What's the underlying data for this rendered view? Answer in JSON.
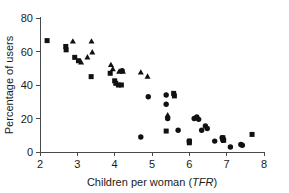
{
  "chart_data": {
    "type": "scatter",
    "title": "",
    "xlabel": "Children per woman (TFR)",
    "xlabel_plain": "Children per woman (",
    "xlabel_italic": "TFR",
    "xlabel_tail": ")",
    "ylabel": "Percentage of users",
    "xlim": [
      2,
      8
    ],
    "ylim": [
      0,
      80
    ],
    "xticks": [
      2,
      3,
      4,
      5,
      6,
      7,
      8
    ],
    "xticklabels": [
      "2",
      "3",
      "4",
      "5",
      "6",
      "7",
      "8"
    ],
    "yticks": [
      0,
      20,
      40,
      60,
      80
    ],
    "yticklabels": [
      "0",
      "20",
      "40",
      "60",
      "80"
    ],
    "grid": false,
    "legend": false,
    "marker_color": "#111111",
    "series": [
      {
        "name": "square",
        "marker": "square",
        "points": [
          [
            2.19,
            66.5
          ],
          [
            2.69,
            63.0
          ],
          [
            2.7,
            61.0
          ],
          [
            2.93,
            56.5
          ],
          [
            3.03,
            54.5
          ],
          [
            3.37,
            45.0
          ],
          [
            3.88,
            47.0
          ],
          [
            4.0,
            42.5
          ],
          [
            4.03,
            41.0
          ],
          [
            4.1,
            40.0
          ],
          [
            4.18,
            40.0
          ],
          [
            5.38,
            12.5
          ],
          [
            5.58,
            35.0
          ],
          [
            5.6,
            33.5
          ],
          [
            6.0,
            6.5
          ],
          [
            6.0,
            5.5
          ],
          [
            6.9,
            8.5
          ],
          [
            6.92,
            7.0
          ],
          [
            7.68,
            10.5
          ]
        ]
      },
      {
        "name": "triangle",
        "marker": "triangle",
        "points": [
          [
            2.88,
            66.0
          ],
          [
            3.38,
            66.0
          ],
          [
            3.1,
            53.5
          ],
          [
            3.27,
            56.5
          ],
          [
            3.4,
            59.5
          ],
          [
            3.9,
            52.0
          ],
          [
            3.95,
            49.5
          ],
          [
            4.22,
            48.0
          ],
          [
            4.7,
            47.5
          ],
          [
            4.88,
            45.0
          ],
          [
            5.42,
            22.0
          ],
          [
            4.12,
            48.0
          ]
        ]
      },
      {
        "name": "circle",
        "marker": "circle",
        "points": [
          [
            4.2,
            48.5
          ],
          [
            4.7,
            9.0
          ],
          [
            4.9,
            33.0
          ],
          [
            5.38,
            34.0
          ],
          [
            5.38,
            28.5
          ],
          [
            5.42,
            20.0
          ],
          [
            5.7,
            13.0
          ],
          [
            6.0,
            6.5
          ],
          [
            6.13,
            20.0
          ],
          [
            6.2,
            21.0
          ],
          [
            6.25,
            19.5
          ],
          [
            6.33,
            13.0
          ],
          [
            6.43,
            15.5
          ],
          [
            6.48,
            14.0
          ],
          [
            6.68,
            6.5
          ],
          [
            6.88,
            8.5
          ],
          [
            6.9,
            7.0
          ],
          [
            7.1,
            3.0
          ],
          [
            7.38,
            4.5
          ],
          [
            7.42,
            4.0
          ]
        ]
      }
    ]
  },
  "layout": {
    "plot_left_px": 40,
    "plot_right_px": 264,
    "plot_top_px": 18,
    "plot_bottom_px": 152
  }
}
